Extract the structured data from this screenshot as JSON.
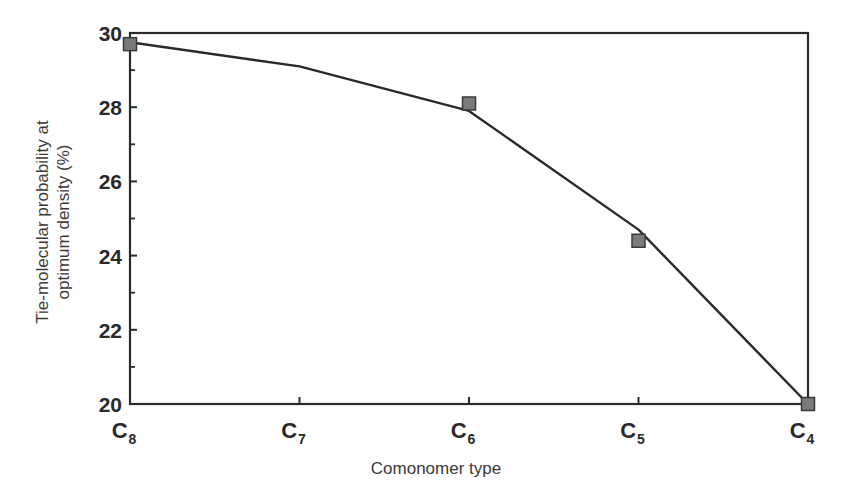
{
  "chart_data": {
    "type": "line",
    "title": "",
    "xlabel": "Comonomer type",
    "ylabel_line1": "Tie-molecular probability at",
    "ylabel_line2": "optimum density (%)",
    "ylabel": "Tie-molecular probability at optimum density (%)",
    "categories": [
      "C8",
      "C7",
      "C6",
      "C5",
      "C4"
    ],
    "category_labels": [
      {
        "base": "C",
        "sub": "8"
      },
      {
        "base": "C",
        "sub": "7"
      },
      {
        "base": "C",
        "sub": "6"
      },
      {
        "base": "C",
        "sub": "5"
      },
      {
        "base": "C",
        "sub": "4"
      }
    ],
    "ylim": [
      20,
      30
    ],
    "yticks": [
      20,
      22,
      24,
      26,
      28,
      30
    ],
    "ytick_labels": [
      "20",
      "22",
      "24",
      "26",
      "28",
      "30"
    ],
    "grid": false,
    "legend": null,
    "series": [
      {
        "name": "Measured",
        "style": "markers",
        "marker": "square",
        "color": "#7a7a7a",
        "points": [
          {
            "x": "C8",
            "y": 29.7
          },
          {
            "x": "C6",
            "y": 28.1
          },
          {
            "x": "C5",
            "y": 24.4
          },
          {
            "x": "C4",
            "y": 20.0
          }
        ]
      },
      {
        "name": "Fitted curve",
        "style": "line",
        "color": "#2a2a2a",
        "points": [
          {
            "x": "C8",
            "y": 29.75
          },
          {
            "x": "C7",
            "y": 29.1
          },
          {
            "x": "C6",
            "y": 27.9
          },
          {
            "x": "C5",
            "y": 24.7
          },
          {
            "x": "C4",
            "y": 20.0
          }
        ]
      }
    ]
  },
  "colors": {
    "axis": "#2a2a2a",
    "line": "#2a2a2a",
    "marker_fill": "#7a7a7a",
    "marker_stroke": "#3a3a3a",
    "text": "#2a2a2a"
  }
}
